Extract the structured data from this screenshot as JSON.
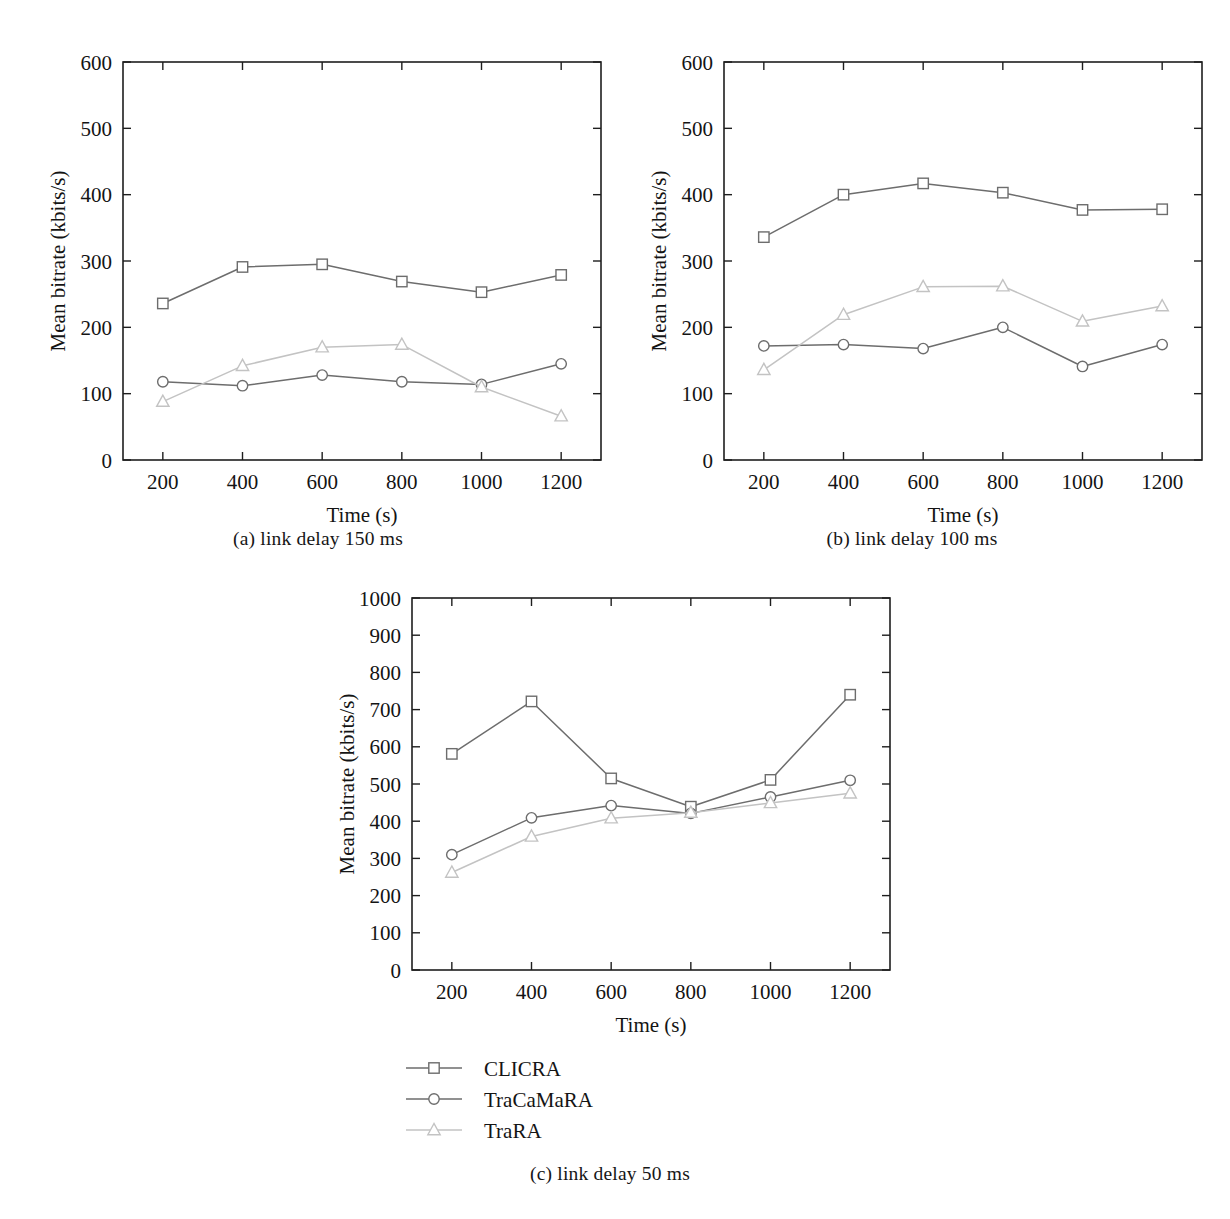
{
  "figure": {
    "panels": [
      {
        "id": "a",
        "caption": "(a)  link delay 150 ms",
        "chart_data": {
          "type": "line",
          "title": "",
          "subtitle": "",
          "xlabel": "Time (s)",
          "ylabel": "Mean bitrate (kbits/s)",
          "x": [
            200,
            400,
            600,
            800,
            1000,
            1200
          ],
          "categories": [
            "200",
            "400",
            "600",
            "800",
            "1000",
            "1200"
          ],
          "xlim": [
            100,
            1300
          ],
          "ylim": [
            0,
            600
          ],
          "yticks": [
            0,
            100,
            200,
            300,
            400,
            500,
            600
          ],
          "xticks": [
            200,
            400,
            600,
            800,
            1000,
            1200
          ],
          "grid": false,
          "legend_position": "below-figure",
          "series": [
            {
              "name": "CLICRA",
              "marker": "square",
              "color": "#6d6d6d",
              "values": [
                236,
                291,
                295,
                269,
                253,
                279
              ]
            },
            {
              "name": "TraCaMaRA",
              "marker": "circle",
              "color": "#6d6d6d",
              "values": [
                118,
                112,
                128,
                118,
                114,
                145
              ]
            },
            {
              "name": "TraRA",
              "marker": "triangle",
              "color": "#c3c3c3",
              "values": [
                88,
                142,
                170,
                174,
                110,
                66
              ]
            }
          ]
        }
      },
      {
        "id": "b",
        "caption": "(b)  link delay 100 ms",
        "chart_data": {
          "type": "line",
          "title": "",
          "subtitle": "",
          "xlabel": "Time (s)",
          "ylabel": "Mean bitrate (kbits/s)",
          "x": [
            200,
            400,
            600,
            800,
            1000,
            1200
          ],
          "categories": [
            "200",
            "400",
            "600",
            "800",
            "1000",
            "1200"
          ],
          "xlim": [
            100,
            1300
          ],
          "ylim": [
            0,
            600
          ],
          "yticks": [
            0,
            100,
            200,
            300,
            400,
            500,
            600
          ],
          "xticks": [
            200,
            400,
            600,
            800,
            1000,
            1200
          ],
          "grid": false,
          "legend_position": "below-figure",
          "series": [
            {
              "name": "CLICRA",
              "marker": "square",
              "color": "#6d6d6d",
              "values": [
                336,
                400,
                417,
                403,
                377,
                378
              ]
            },
            {
              "name": "TraCaMaRA",
              "marker": "circle",
              "color": "#6d6d6d",
              "values": [
                172,
                174,
                168,
                200,
                141,
                174
              ]
            },
            {
              "name": "TraRA",
              "marker": "triangle",
              "color": "#c3c3c3",
              "values": [
                136,
                219,
                261,
                262,
                209,
                232
              ]
            }
          ]
        }
      },
      {
        "id": "c",
        "caption": "(c)  link delay 50 ms",
        "chart_data": {
          "type": "line",
          "title": "",
          "subtitle": "",
          "xlabel": "Time (s)",
          "ylabel": "Mean bitrate (kbits/s)",
          "x": [
            200,
            400,
            600,
            800,
            1000,
            1200
          ],
          "categories": [
            "200",
            "400",
            "600",
            "800",
            "1000",
            "1200"
          ],
          "xlim": [
            100,
            1300
          ],
          "ylim": [
            0,
            1000
          ],
          "yticks": [
            0,
            100,
            200,
            300,
            400,
            500,
            600,
            700,
            800,
            900,
            1000
          ],
          "xticks": [
            200,
            400,
            600,
            800,
            1000,
            1200
          ],
          "grid": false,
          "legend_position": "below-figure",
          "series": [
            {
              "name": "CLICRA",
              "marker": "square",
              "color": "#6d6d6d",
              "values": [
                581,
                722,
                515,
                439,
                511,
                740
              ]
            },
            {
              "name": "TraCaMaRA",
              "marker": "circle",
              "color": "#6d6d6d",
              "values": [
                310,
                409,
                442,
                421,
                465,
                510
              ]
            },
            {
              "name": "TraRA",
              "marker": "triangle",
              "color": "#c3c3c3",
              "values": [
                262,
                359,
                408,
                423,
                449,
                475
              ]
            }
          ]
        }
      }
    ],
    "legend": {
      "items": [
        {
          "label": "CLICRA",
          "marker": "square",
          "color": "#6d6d6d"
        },
        {
          "label": "TraCaMaRA",
          "marker": "circle",
          "color": "#6d6d6d"
        },
        {
          "label": "TraRA",
          "marker": "triangle",
          "color": "#c3c3c3"
        }
      ]
    }
  }
}
